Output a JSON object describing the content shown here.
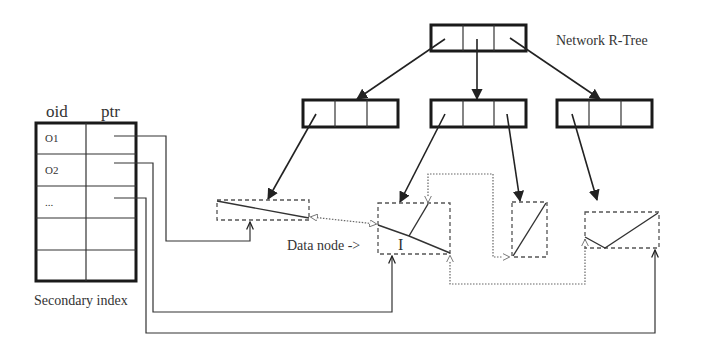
{
  "diagram": {
    "title": "Network R-Tree",
    "secondary_index": {
      "caption": "Secondary index",
      "headers": {
        "oid": "oid",
        "ptr": "ptr"
      },
      "rows": [
        {
          "oid": "O1"
        },
        {
          "oid": "O2"
        },
        {
          "oid": "..."
        },
        {
          "oid": ""
        },
        {
          "oid": ""
        }
      ]
    },
    "data_node_label": "Data node ->",
    "segment_label": "I",
    "rtree": {
      "root": {
        "entries": 3
      },
      "level1": [
        {
          "name": "left-node",
          "entries": 3
        },
        {
          "name": "middle-node",
          "entries": 3
        },
        {
          "name": "right-node",
          "entries": 3
        }
      ]
    },
    "data_nodes": [
      {
        "name": "data-node-1"
      },
      {
        "name": "data-node-2",
        "label": "I"
      },
      {
        "name": "data-node-3"
      },
      {
        "name": "data-node-4"
      }
    ],
    "colors": {
      "stroke": "#1a1a1a",
      "dashed": "#555555",
      "background": "#ffffff",
      "text": "#333333"
    }
  }
}
